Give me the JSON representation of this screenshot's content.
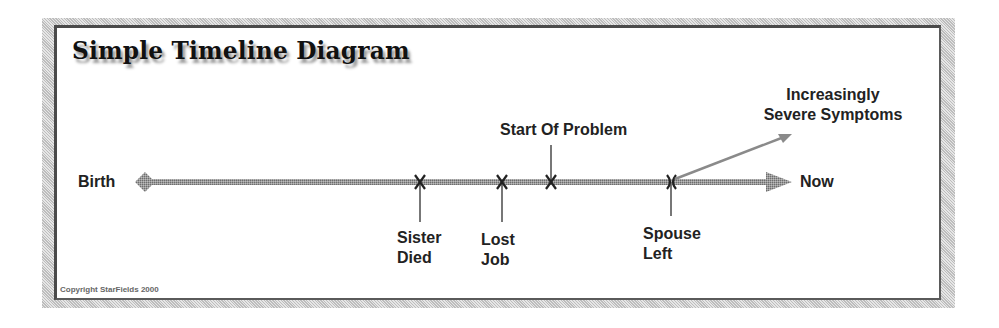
{
  "diagram": {
    "title": "Simple Timeline Diagram",
    "timeline": {
      "start_label": "Birth",
      "end_label": "Now",
      "line_color": "#8a8a8a"
    },
    "events": [
      {
        "label_line1": "Sister",
        "label_line2": "Died",
        "position": "below"
      },
      {
        "label_line1": "Lost",
        "label_line2": "Job",
        "position": "below"
      },
      {
        "label_line1": "Start Of Problem",
        "label_line2": "",
        "position": "above"
      },
      {
        "label_line1": "Spouse",
        "label_line2": "Left",
        "position": "below"
      }
    ],
    "annotation": {
      "line1": "Increasingly",
      "line2": "Severe Symptoms"
    },
    "copyright": "Copyright StarFields 2000"
  }
}
